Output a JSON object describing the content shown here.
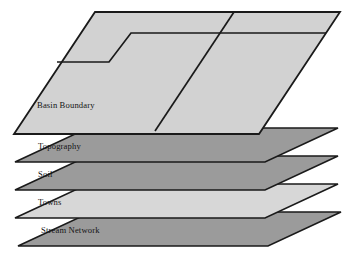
{
  "diagram": {
    "type": "layered-map-overlay",
    "layer_count": 5,
    "layers": [
      {
        "index": 0,
        "label": "Basin Boundary",
        "fill": "#d2d2d2",
        "stroke": "#1a1a1a",
        "position": "top",
        "has_features": true,
        "feature_description": "basin boundary polylines subdividing the plane"
      },
      {
        "index": 1,
        "label": "Topography",
        "fill": "#9b9b9b",
        "stroke": "#1a1a1a",
        "position": "second",
        "has_features": false
      },
      {
        "index": 2,
        "label": "Soil",
        "fill": "#9b9b9b",
        "stroke": "#1a1a1a",
        "position": "third",
        "has_features": false
      },
      {
        "index": 3,
        "label": "Towns",
        "fill": "#d7d7d7",
        "stroke": "#1a1a1a",
        "position": "fourth",
        "has_features": false
      },
      {
        "index": 4,
        "label": "Stream Network",
        "fill": "#9b9b9b",
        "stroke": "#1a1a1a",
        "position": "bottom",
        "has_features": false
      }
    ],
    "background": "#ffffff"
  }
}
